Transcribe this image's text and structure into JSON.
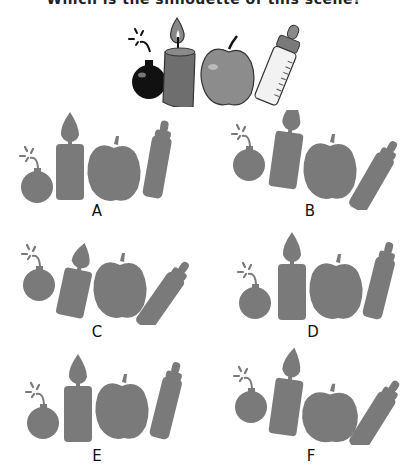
{
  "question": {
    "title": "Which is the silhouette of this scene?",
    "title_visible_fragment": "...ouette of this scene?"
  },
  "scene": {
    "objects": [
      "bomb",
      "candle",
      "apple",
      "baby-bottle"
    ]
  },
  "options": [
    {
      "label": "A",
      "description": "bomb, tall candle, apple, upright bottle"
    },
    {
      "label": "B",
      "description": "bomb, tilted candle, apple, tilted bottle"
    },
    {
      "label": "C",
      "description": "bomb, short tilted candle, apple, steeply tilted bottle"
    },
    {
      "label": "D",
      "description": "bomb low, tall candle, apple, upright bottle"
    },
    {
      "label": "E",
      "description": "bomb low, tall candle, apple, upright bottle"
    },
    {
      "label": "F",
      "description": "bomb, tilted candle, flat apple, tilted bottle"
    }
  ],
  "colors": {
    "silhouette": "#7a7a7a",
    "bomb": "#111111",
    "candle": "#6e6e6e",
    "apple": "#8c8c8c",
    "bottle": "#f2f2f2",
    "text": "#111111"
  }
}
